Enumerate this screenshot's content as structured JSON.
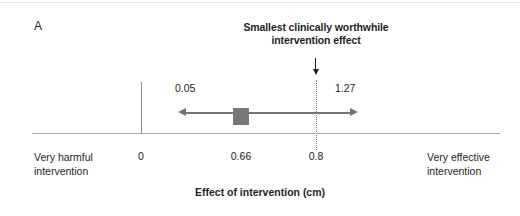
{
  "panel": {
    "letter": "A"
  },
  "annotation": {
    "title_line1": "Smallest clinically worthwhile",
    "title_line2": "intervention effect",
    "arrow_icon": "down-arrow-icon"
  },
  "axis": {
    "title": "Effect of intervention (cm)",
    "left_end_line1": "Very harmful",
    "left_end_line2": "intervention",
    "right_end_line1": "Very effective",
    "right_end_line2": "intervention"
  },
  "labels": {
    "zero": "0",
    "point_estimate": "0.66",
    "threshold": "0.8",
    "ci_lower": "0.05",
    "ci_upper": "1.27"
  },
  "colors": {
    "text": "#231f20",
    "baseline": "#a9a9a9",
    "zero_line": "#8c8c8c",
    "threshold_line": "#7a7a7a",
    "ci_arrow": "#767676",
    "marker": "#787878",
    "background": "#ffffff"
  },
  "chart_data": {
    "type": "scatter",
    "title": "Smallest clinically worthwhile intervention effect",
    "xlabel": "Effect of intervention (cm)",
    "ylabel": "",
    "xlim": [
      -0.5,
      2.2
    ],
    "grid": false,
    "legend": null,
    "series": [
      {
        "name": "Intervention effect",
        "point_estimate": 0.66,
        "ci_lower": 0.05,
        "ci_upper": 1.27,
        "marker": "square",
        "interval_style": "double-headed-arrow"
      }
    ],
    "reference_lines": [
      {
        "name": "no effect",
        "value": 0,
        "style": "solid",
        "label": "0"
      },
      {
        "name": "smallest clinically worthwhile intervention effect",
        "value": 0.8,
        "style": "dotted",
        "label": "0.8"
      }
    ],
    "annotations": [
      {
        "text": "0.05",
        "x": 0.05,
        "role": "ci-lower-value"
      },
      {
        "text": "1.27",
        "x": 1.27,
        "role": "ci-upper-value"
      },
      {
        "text": "0.66",
        "x": 0.66,
        "role": "point-estimate-value"
      },
      {
        "text": "0.8",
        "x": 0.8,
        "role": "threshold-value"
      },
      {
        "text": "Very harmful intervention",
        "x": -0.45,
        "role": "axis-left-end"
      },
      {
        "text": "Very effective intervention",
        "x": 2.1,
        "role": "axis-right-end"
      },
      {
        "text": "Smallest clinically worthwhile intervention effect",
        "x": 0.8,
        "role": "threshold-callout"
      }
    ]
  }
}
